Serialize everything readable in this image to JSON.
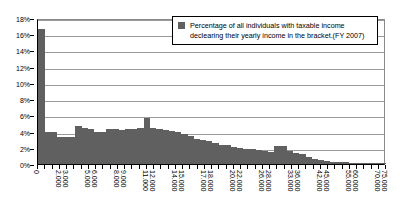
{
  "legend": {
    "swatch_color": "#606060",
    "label": "Percentage of all individuals with taxable income declearing their yearly income in the bracket.(FY 2007)"
  },
  "axes": {
    "y_tick_labels": [
      "18%",
      "16%",
      "14%",
      "12%",
      "10%",
      "8%",
      "6%",
      "4%",
      "2%",
      "0%"
    ],
    "x_tick_labels": [
      "0",
      "",
      "",
      "2.000",
      "3.000",
      "",
      "",
      "5.000",
      "6.000",
      "",
      "",
      "8.000",
      "9.000",
      "",
      "",
      "11.000",
      "12.000",
      "",
      "",
      "14.000",
      "15.000",
      "",
      "",
      "17.000",
      "18.000",
      "",
      "",
      "20.000",
      "22.000",
      "",
      "",
      "26.000",
      "28.000",
      "",
      "",
      "33.000",
      "36.000",
      "",
      "",
      "42.000",
      "45.000",
      "",
      "",
      "55.000",
      "60.000",
      "",
      "",
      "70.000",
      "75.000"
    ]
  },
  "chart_data": {
    "type": "bar",
    "title": "",
    "subtitle": "",
    "xlabel": "",
    "ylabel": "",
    "ylim": [
      0,
      18
    ],
    "y_tick_step": 2,
    "grid": true,
    "legend_position": "top-right",
    "bar_color": "#606060",
    "series": [
      {
        "name": "Percentage of all individuals with taxable income declearing their yearly income in the bracket.(FY 2007)",
        "values": [
          16.7,
          4.0,
          3.9,
          3.3,
          3.3,
          3.3,
          4.7,
          4.4,
          4.3,
          4.0,
          4.0,
          4.3,
          4.3,
          4.2,
          4.3,
          4.3,
          4.4,
          5.7,
          4.5,
          4.3,
          4.2,
          4.1,
          3.9,
          3.7,
          3.5,
          3.1,
          3.0,
          2.8,
          2.6,
          2.4,
          2.3,
          2.1,
          2.0,
          1.9,
          1.8,
          1.7,
          1.6,
          1.5,
          2.2,
          2.2,
          1.6,
          1.4,
          1.2,
          0.9,
          0.6,
          0.5,
          0.4,
          0.3,
          0.25,
          0.2,
          0.15,
          0.12,
          0.1,
          0.08,
          0.06,
          0.05
        ]
      }
    ],
    "categories": [
      "0",
      "500",
      "1.000",
      "1.500",
      "2.000",
      "2.500",
      "3.000",
      "3.500",
      "4.000",
      "4.500",
      "5.000",
      "5.500",
      "6.000",
      "6.500",
      "7.000",
      "7.500",
      "8.000",
      "9.000",
      "9.500",
      "10.000",
      "10.500",
      "11.000",
      "11.500",
      "12.000",
      "12.500",
      "13.000",
      "13.500",
      "14.000",
      "14.500",
      "15.000",
      "15.500",
      "16.000",
      "16.500",
      "17.000",
      "17.500",
      "18.000",
      "19.000",
      "19.500",
      "20.000",
      "21.000",
      "22.000",
      "24.000",
      "26.000",
      "28.000",
      "30.000",
      "33.000",
      "36.000",
      "39.000",
      "42.000",
      "45.000",
      "50.000",
      "55.000",
      "60.000",
      "65.000",
      "70.000",
      "75.000"
    ]
  }
}
